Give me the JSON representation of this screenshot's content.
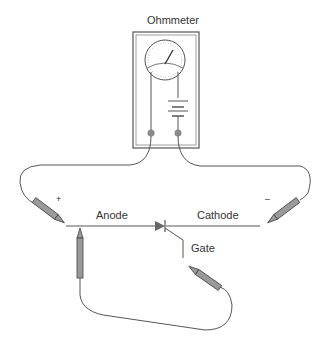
{
  "diagram": {
    "title": "Ohmmeter",
    "labels": {
      "anode": "Anode",
      "cathode": "Cathode",
      "gate": "Gate",
      "plus": "+",
      "minus": "–"
    },
    "components": [
      "ohmmeter",
      "battery",
      "SCR",
      "positive probe",
      "negative probe",
      "gate jumper probe"
    ],
    "colors": {
      "wire": "#555555",
      "probe_fill": "#9a9a9a",
      "terminal": "#8a8a8a",
      "text": "#333333"
    }
  }
}
